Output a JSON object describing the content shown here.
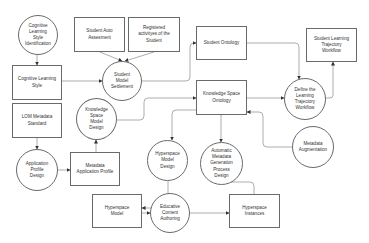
{
  "diagram": {
    "nodes": {
      "cognitive_learning_style_identification": {
        "label": "Cognitive\nLearning\nStyle\nIdentification",
        "shape": "circle"
      },
      "student_auto_assesment": {
        "label": "Student Auto\nAssesment",
        "shape": "box"
      },
      "registered_activities": {
        "label": "Registered\nactivityes of the\nStudent",
        "shape": "box"
      },
      "student_ontology": {
        "label": "Student Ontology",
        "shape": "box"
      },
      "student_learning_trajectory_workflow": {
        "label": "Student Learning\nTrajectory\nWorkflow",
        "shape": "box"
      },
      "cognitive_learning_style": {
        "label": "Cognitive Learning\nStyle",
        "shape": "box"
      },
      "student_model_settlement": {
        "label": "Student\nModel\nSettlement",
        "shape": "circle"
      },
      "knowledge_space_model_design": {
        "label": "Knowledge\nSpace\nModel\nDesign",
        "shape": "circle"
      },
      "knowledge_space_ontology": {
        "label": "Knowledge Space\nOntology",
        "shape": "box"
      },
      "define_learning_trajectory_workflow": {
        "label": "Define the\nLearning\nTrajectory\nWorkflow",
        "shape": "circle"
      },
      "ldm_metadata_standard": {
        "label": "LOM Metadata\nStandard",
        "shape": "box"
      },
      "metadata_augmentation": {
        "label": "Metadata\nAugmentation",
        "shape": "circle"
      },
      "automatic_metadata_generation": {
        "label": "Automatic\nMetadata\nGeneration\nProcess\nDesign",
        "shape": "circle"
      },
      "hyperspace_model_design": {
        "label": "Hyperspace\nModel\nDesign",
        "shape": "circle"
      },
      "application_profile_design": {
        "label": "Application\nProfile\nDesign",
        "shape": "circle"
      },
      "metadata_application_profile": {
        "label": "Metadata\nApplication Profile",
        "shape": "box"
      },
      "hyperspace_model": {
        "label": "Hyperspace\nModel",
        "shape": "box"
      },
      "educative_content_authoring": {
        "label": "Educative\nContent\nAuthoring",
        "shape": "circle"
      },
      "hyperspace_instances": {
        "label": "Hyperspace\nInstances",
        "shape": "box"
      }
    },
    "edges": [
      {
        "from": "Cognitive Learning Style Identification",
        "to": "Cognitive Learning Style"
      },
      {
        "from": "Cognitive Learning Style",
        "to": "Student Model Settlement"
      },
      {
        "from": "Student Auto Assesment",
        "to": "Student Model Settlement"
      },
      {
        "from": "Registered activityes of the Student",
        "to": "Student Model Settlement"
      },
      {
        "from": "Student Model Settlement",
        "to": "Student Ontology"
      },
      {
        "from": "Student Ontology",
        "to": "Define the Learning Trajectory Workflow"
      },
      {
        "from": "Knowledge Space Ontology",
        "to": "Define the Learning Trajectory Workflow"
      },
      {
        "from": "Define the Learning Trajectory Workflow",
        "to": "Student Learning Trajectory Workflow"
      },
      {
        "from": "Knowledge Space Model Design",
        "to": "Knowledge Space Ontology"
      },
      {
        "from": "LOM Metadata Standard",
        "to": "Application Profile Design"
      },
      {
        "from": "Application Profile Design",
        "to": "Metadata Application Profile"
      },
      {
        "from": "Metadata Application Profile",
        "to": "Knowledge Space Model Design"
      },
      {
        "from": "Knowledge Space Ontology",
        "to": "Hyperspace Model Design"
      },
      {
        "from": "Knowledge Space Ontology",
        "to": "Automatic Metadata Generation Process Design"
      },
      {
        "from": "Metadata Augmentation",
        "to": "Knowledge Space Ontology"
      },
      {
        "from": "Hyperspace Model Design",
        "to": "Hyperspace Model"
      },
      {
        "from": "Hyperspace Model",
        "to": "Educative Content Authoring"
      },
      {
        "from": "Educative Content Authoring",
        "to": "Hyperspace Instances"
      },
      {
        "from": "Hyperspace Instances",
        "to": "Automatic Metadata Generation Process Design"
      }
    ],
    "colors": {
      "stroke": "#6a6a6a",
      "text": "#333333",
      "background": "#ffffff"
    }
  }
}
